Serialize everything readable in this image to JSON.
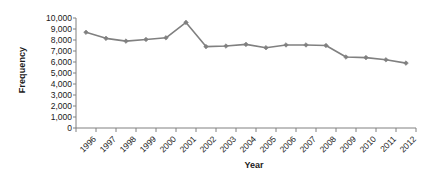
{
  "chart_data": {
    "type": "line",
    "title": "",
    "xlabel": "Year",
    "ylabel": "Frequency",
    "categories": [
      "1996",
      "1997",
      "1998",
      "1999",
      "2000",
      "2001",
      "2002",
      "2003",
      "2004",
      "2005",
      "2006",
      "2007",
      "2008",
      "2009",
      "2010",
      "2011",
      "2012"
    ],
    "values": [
      8700,
      8150,
      7900,
      8050,
      8200,
      9600,
      7400,
      7450,
      7600,
      7300,
      7550,
      7550,
      7500,
      6450,
      6400,
      6200,
      5900
    ],
    "series": [
      {
        "name": "Frequency",
        "values": [
          8700,
          8150,
          7900,
          8050,
          8200,
          9600,
          7400,
          7450,
          7600,
          7300,
          7550,
          7550,
          7500,
          6450,
          6400,
          6200,
          5900
        ]
      }
    ],
    "ylim": [
      0,
      10000
    ],
    "ytick_values": [
      0,
      1000,
      2000,
      3000,
      4000,
      5000,
      6000,
      7000,
      8000,
      9000,
      10000
    ],
    "ytick_labels": [
      "0",
      "1,000",
      "2,000",
      "3,000",
      "4,000",
      "5,000",
      "6,000",
      "7,000",
      "8,000",
      "9,000",
      "10,000"
    ],
    "grid": false,
    "legend": "none",
    "line_color": "#808080",
    "marker_color": "#808080",
    "marker_shape": "diamond",
    "axis_color": "#808080",
    "text_color": "#1a1a1a",
    "xtick_rotation": -45
  }
}
